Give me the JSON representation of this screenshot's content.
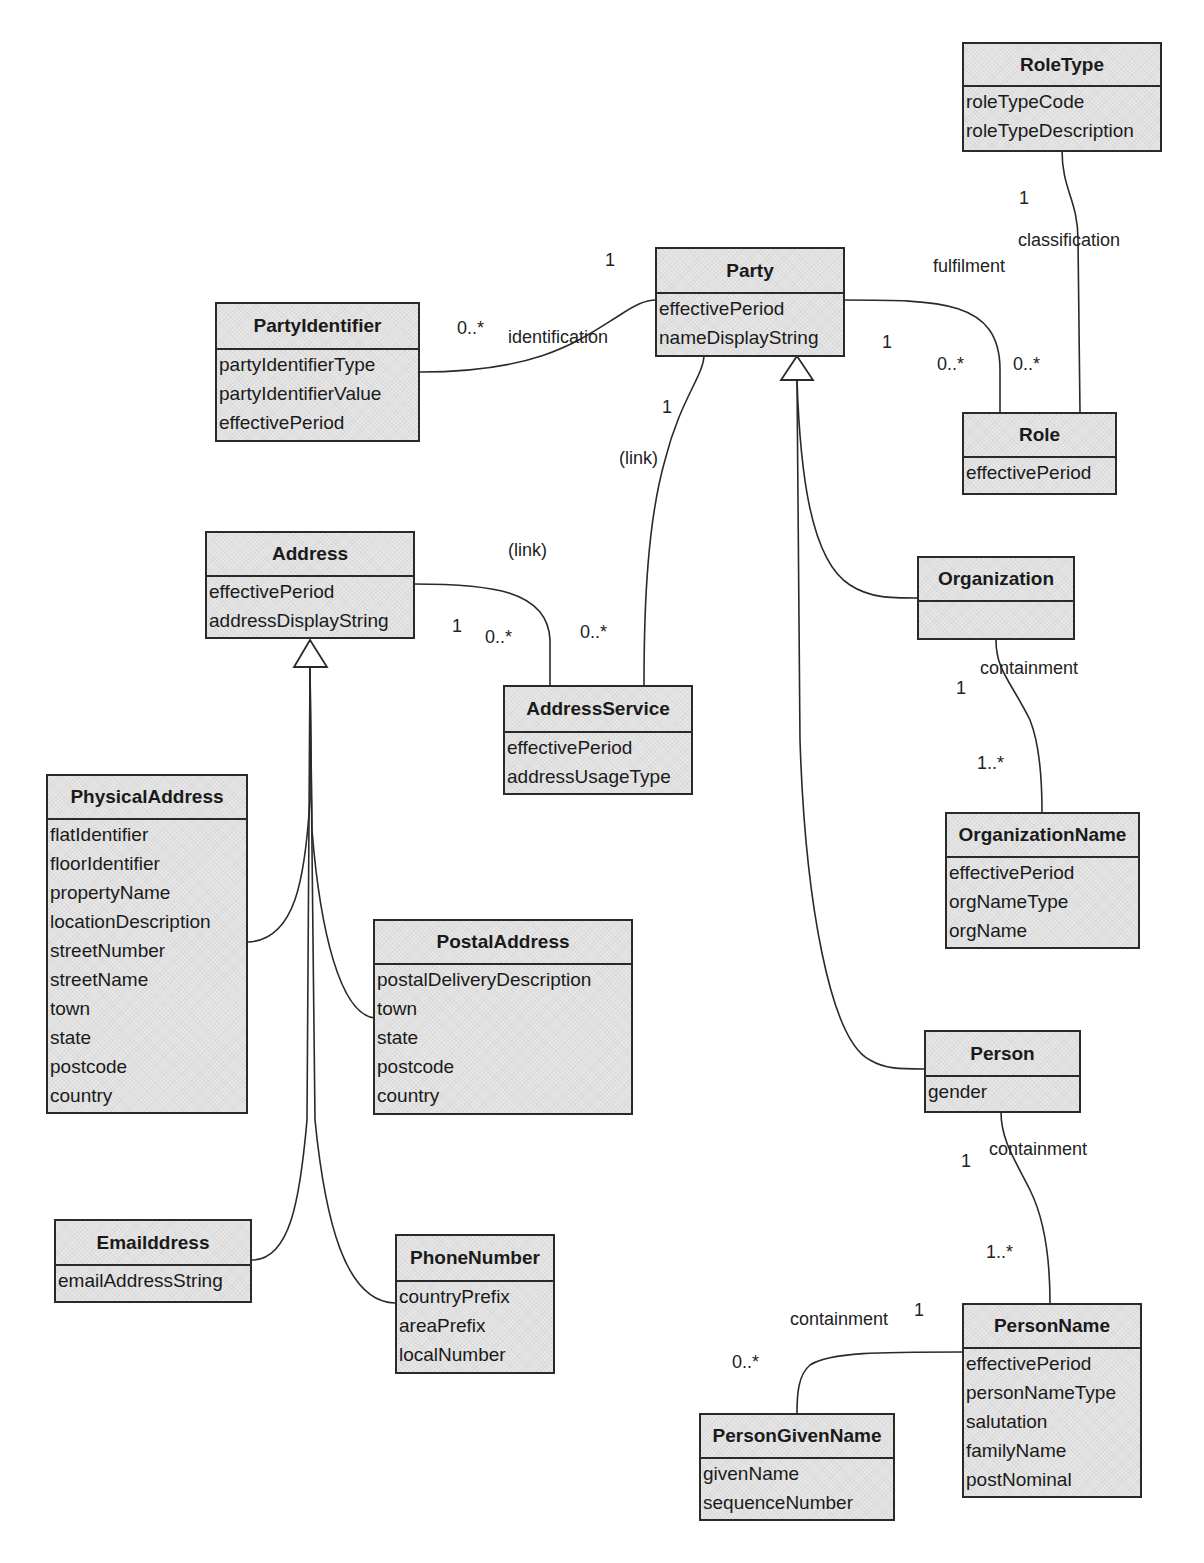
{
  "diagram": {
    "classes": {
      "roleType": {
        "name": "RoleType",
        "attributes": [
          "roleTypeCode",
          "roleTypeDescription"
        ]
      },
      "party": {
        "name": "Party",
        "attributes": [
          "effectivePeriod",
          "nameDisplayString"
        ]
      },
      "partyIdentifier": {
        "name": "PartyIdentifier",
        "attributes": [
          "partyIdentifierType",
          "partyIdentifierValue",
          "effectivePeriod"
        ]
      },
      "role": {
        "name": "Role",
        "attributes": [
          "effectivePeriod"
        ]
      },
      "address": {
        "name": "Address",
        "attributes": [
          "effectivePeriod",
          "addressDisplayString"
        ]
      },
      "addressService": {
        "name": "AddressService",
        "attributes": [
          "effectivePeriod",
          "addressUsageType"
        ]
      },
      "organization": {
        "name": "Organization",
        "attributes": []
      },
      "organizationName": {
        "name": "OrganizationName",
        "attributes": [
          "effectivePeriod",
          "orgNameType",
          "orgName"
        ]
      },
      "physicalAddress": {
        "name": "PhysicalAddress",
        "attributes": [
          "flatIdentifier",
          "floorIdentifier",
          "propertyName",
          "locationDescription",
          "streetNumber",
          "streetName",
          "town",
          "state",
          "postcode",
          "country"
        ]
      },
      "postalAddress": {
        "name": "PostalAddress",
        "attributes": [
          "postalDeliveryDescription",
          "town",
          "state",
          "postcode",
          "country"
        ]
      },
      "person": {
        "name": "Person",
        "attributes": [
          "gender"
        ]
      },
      "emailAddress": {
        "name": "Emailddress",
        "attributes": [
          "emailAddressString"
        ]
      },
      "phoneNumber": {
        "name": "PhoneNumber",
        "attributes": [
          "countryPrefix",
          "areaPrefix",
          "localNumber"
        ]
      },
      "personName": {
        "name": "PersonName",
        "attributes": [
          "effectivePeriod",
          "personNameType",
          "salutation",
          "familyName",
          "postNominal"
        ]
      },
      "personGivenName": {
        "name": "PersonGivenName",
        "attributes": [
          "givenName",
          "sequenceNumber"
        ]
      }
    },
    "labels": {
      "roleType_mult_1": "1",
      "classification": "classification",
      "fulfilment": "fulfilment",
      "party_ident_1": "1",
      "partyIdentifier_mult": "0..*",
      "identification": "identification",
      "party_role_1": "1",
      "role_mult_fulfil": "0..*",
      "role_mult_class": "0..*",
      "party_link_1": "1",
      "link_party": "(link)",
      "link_address": "(link)",
      "address_mult_1": "1",
      "addressService_mult_a": "0..*",
      "addressService_mult_b": "0..*",
      "org_mult_1": "1",
      "org_containment": "containment",
      "orgName_mult": "1..*",
      "person_mult_1": "1",
      "person_containment": "containment",
      "personName_mult": "1..*",
      "pgn_containment": "containment",
      "personName_mult_1": "1",
      "personGivenName_mult": "0..*"
    },
    "colors": {
      "box_fill": "#e6e6e6",
      "line": "#2a2a2a"
    }
  }
}
